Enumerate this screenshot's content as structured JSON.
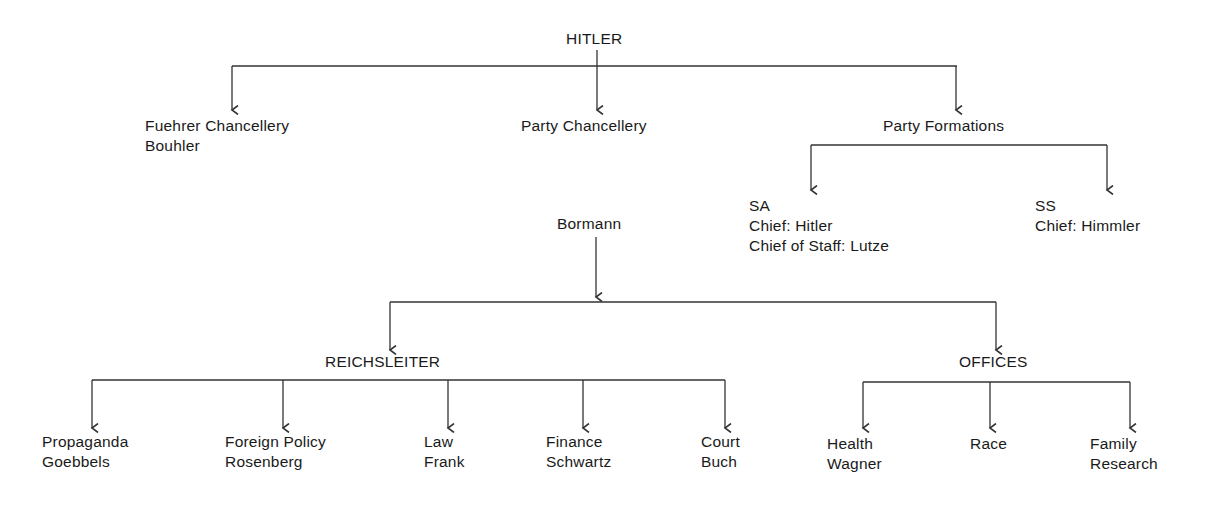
{
  "diagram": {
    "type": "org-chart",
    "root": {
      "label": "HITLER"
    },
    "level1": [
      {
        "lines": [
          "Fuehrer Chancellery",
          "Bouhler"
        ]
      },
      {
        "lines": [
          "Party Chancellery"
        ]
      },
      {
        "lines": [
          "Party Formations"
        ]
      }
    ],
    "party_formations": {
      "sa": {
        "lines": [
          "SA",
          "Chief: Hitler",
          "Chief of Staff: Lutze"
        ]
      },
      "ss": {
        "lines": [
          "SS",
          "Chief: Himmler"
        ]
      }
    },
    "party_chancellery_head": {
      "label": "Bormann"
    },
    "bormann_branches": {
      "reichsleiter": {
        "label": "REICHSLEITER"
      },
      "offices": {
        "label": "OFFICES"
      }
    },
    "reichsleiter_items": [
      {
        "lines": [
          "Propaganda",
          "Goebbels"
        ]
      },
      {
        "lines": [
          "Foreign Policy",
          "Rosenberg"
        ]
      },
      {
        "lines": [
          "Law",
          "Frank"
        ]
      },
      {
        "lines": [
          "Finance",
          "Schwartz"
        ]
      },
      {
        "lines": [
          "Court",
          "Buch"
        ]
      }
    ],
    "offices_items": [
      {
        "lines": [
          "Health",
          "Wagner"
        ]
      },
      {
        "lines": [
          "Race"
        ]
      },
      {
        "lines": [
          "Family",
          "Research"
        ]
      }
    ],
    "colors": {
      "line": "#333333",
      "text": "#1a1a1a",
      "background": "#ffffff"
    }
  }
}
